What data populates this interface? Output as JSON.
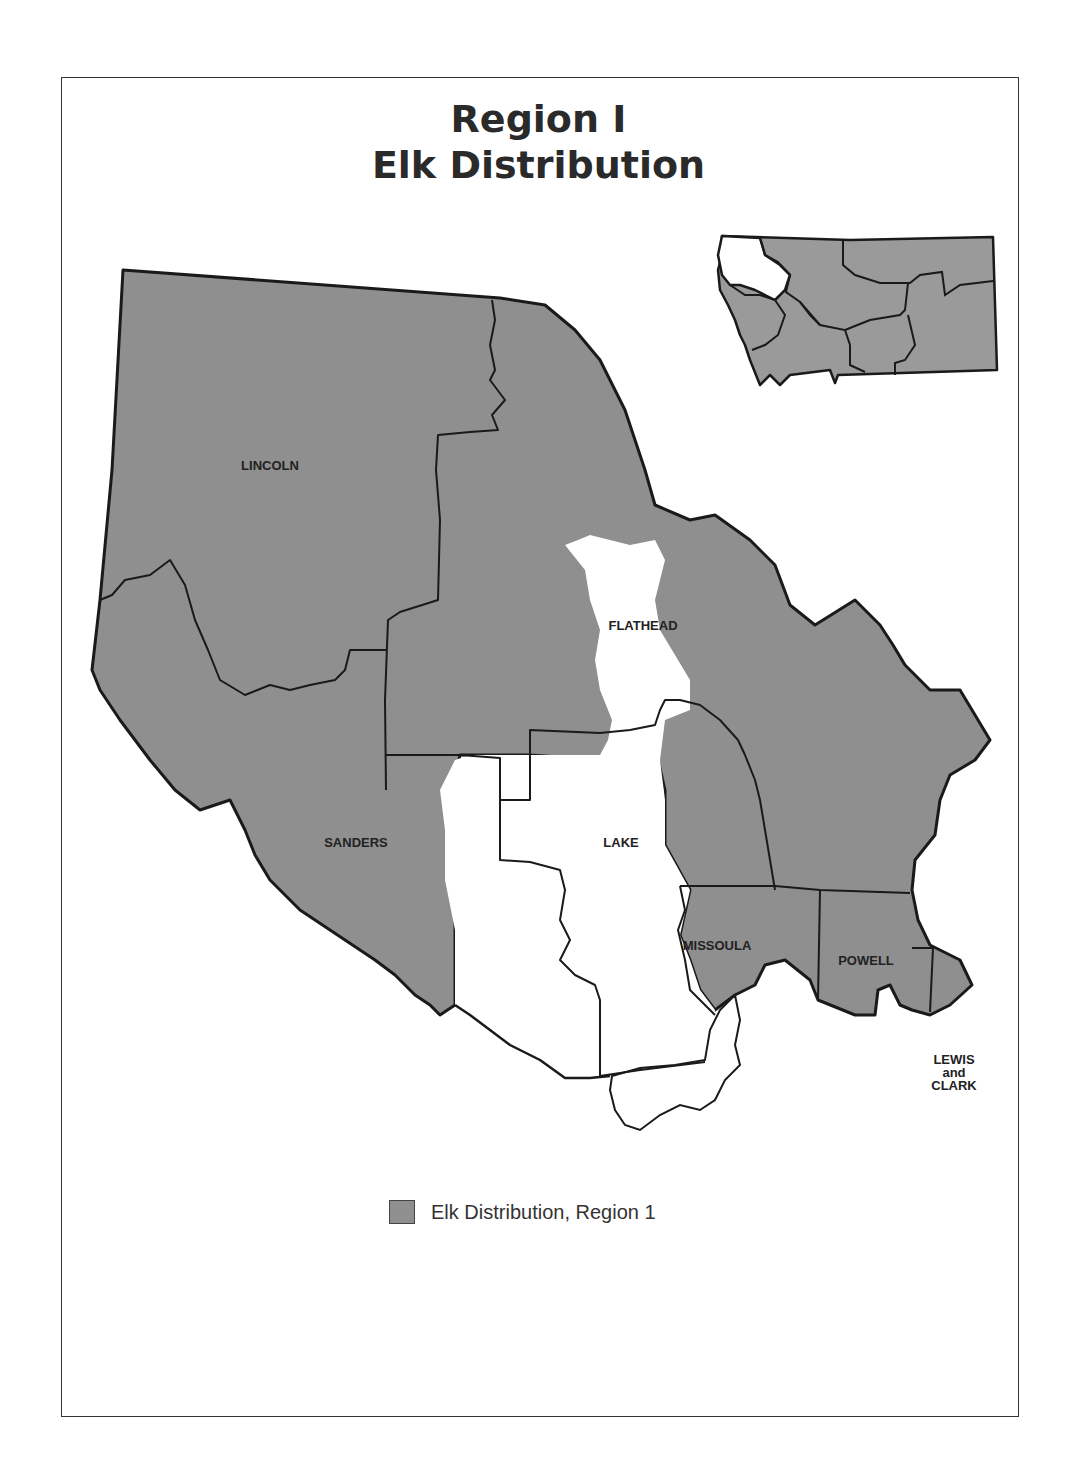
{
  "page_header": "",
  "title": {
    "line1": "Region I",
    "line2": "Elk Distribution"
  },
  "map": {
    "counties": [
      {
        "name": "LINCOLN",
        "x": 270,
        "y": 470
      },
      {
        "name": "FLATHEAD",
        "x": 643,
        "y": 630
      },
      {
        "name": "SANDERS",
        "x": 356,
        "y": 847
      },
      {
        "name": "LAKE",
        "x": 621,
        "y": 847
      },
      {
        "name": "MISSOULA",
        "x": 717,
        "y": 950
      },
      {
        "name": "POWELL",
        "x": 866,
        "y": 965
      },
      {
        "name": "LEWIS",
        "x": 954,
        "y": 1064
      },
      {
        "name": "and",
        "x": 954,
        "y": 1077
      },
      {
        "name": "CLARK",
        "x": 954,
        "y": 1090
      }
    ],
    "colors": {
      "elk_fill": "#8f8f8f",
      "no_elk_fill": "#ffffff",
      "boundary": "#1a1a1a"
    }
  },
  "inset": {
    "description": "Montana state with Region 1 highlighted in white"
  },
  "legend": {
    "label": "Elk Distribution, Region 1",
    "swatch_color": "#8f8f8f"
  }
}
